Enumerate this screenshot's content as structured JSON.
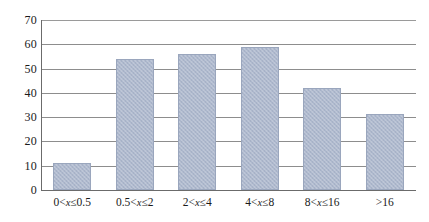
{
  "chart_data": {
    "type": "bar",
    "title": "",
    "subtitle": "",
    "xlabel": "",
    "ylabel": "",
    "categories": [
      "0<x≤0.5",
      "0.5<x≤2",
      "2<x≤4",
      "4<x≤8",
      "8<x≤16",
      ">16"
    ],
    "category_parts": [
      {
        "pre": "0<",
        "var": "x",
        "post": "≤0.5"
      },
      {
        "pre": "0.5<",
        "var": "x",
        "post": "≤2"
      },
      {
        "pre": "2<",
        "var": "x",
        "post": "≤4"
      },
      {
        "pre": "4<",
        "var": "x",
        "post": "≤8"
      },
      {
        "pre": "8<",
        "var": "x",
        "post": "≤16"
      },
      {
        "pre": ">16",
        "var": "",
        "post": ""
      }
    ],
    "values": [
      11,
      54,
      56,
      59,
      42,
      31.5
    ],
    "ylim": [
      0,
      70
    ],
    "ytick_values": [
      0,
      10,
      20,
      30,
      40,
      50,
      60,
      70
    ],
    "ytick_labels": [
      "0",
      "10",
      "20",
      "30",
      "40",
      "50",
      "60",
      "70"
    ],
    "grid": true,
    "grid_orientation": "horizontal",
    "legend": false,
    "legend_position": "none",
    "bar_color": "#adb8cd",
    "bar_border_color": "#9aa6bd",
    "gridline_color": "#8d8d8d",
    "axis_color": "#6b6b6b",
    "text_color": "#1a1a1a",
    "background": "#ffffff"
  }
}
